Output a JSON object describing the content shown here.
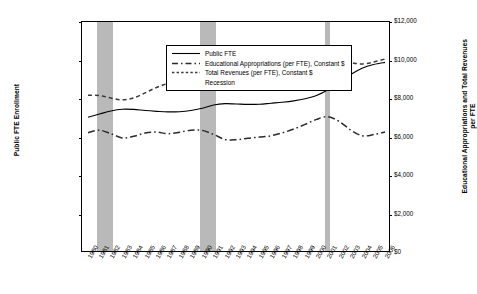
{
  "chart_data": {
    "type": "line",
    "title": "",
    "xlabel": "",
    "ylabel": "Public FTE Enrollment",
    "y2label": "Educational Appropriations and Total Revenues per FTE",
    "grid": false,
    "legend_position": "top-left",
    "ylim": [
      0,
      12000000
    ],
    "y2lim": [
      0,
      12000
    ],
    "yticks": [
      "0",
      "2,000,000",
      "4,000,000",
      "6,000,000",
      "8,000,000",
      "10,000,000",
      "12,000,000"
    ],
    "y2ticks": [
      "$0",
      "$2,000",
      "$4,000",
      "$6,000",
      "$8,000",
      "$10,000",
      "$12,000"
    ],
    "categories": [
      "1980",
      "1981",
      "1982",
      "1983",
      "1984",
      "1985",
      "1986",
      "1987",
      "1988",
      "1989",
      "1990",
      "1991",
      "1992",
      "1993",
      "1994",
      "1995",
      "1996",
      "1997",
      "1998",
      "1999",
      "2000",
      "2001",
      "2002",
      "2003",
      "2004",
      "2005",
      "2006"
    ],
    "series": [
      {
        "name": "Public FTE",
        "axis": "left",
        "style": "solid",
        "values": [
          7050000,
          7220000,
          7380000,
          7470000,
          7460000,
          7400000,
          7360000,
          7330000,
          7340000,
          7400000,
          7520000,
          7690000,
          7760000,
          7740000,
          7720000,
          7730000,
          7780000,
          7830000,
          7900000,
          8010000,
          8180000,
          8480000,
          8900000,
          9280000,
          9600000,
          9790000,
          9900000
        ]
      },
      {
        "name": "Educational Appropriations (per FTE), Constant $",
        "axis": "right",
        "style": "dash-dot",
        "values": [
          6250,
          6380,
          6200,
          5980,
          6060,
          6230,
          6280,
          6200,
          6270,
          6380,
          6370,
          6160,
          5900,
          5880,
          5960,
          6020,
          6090,
          6240,
          6440,
          6680,
          6940,
          7080,
          6830,
          6390,
          6090,
          6150,
          6290
        ]
      },
      {
        "name": "Total Revenues (per FTE), Constant $",
        "axis": "right",
        "style": "dotted",
        "values": [
          8200,
          8180,
          8050,
          7960,
          8060,
          8320,
          8600,
          8820,
          9050,
          9280,
          9460,
          9490,
          9470,
          9460,
          9500,
          9520,
          9500,
          9530,
          9580,
          9700,
          9880,
          10100,
          10080,
          9900,
          9820,
          9920,
          10080
        ]
      }
    ],
    "recession_bands": [
      {
        "label": "Recession",
        "start": "1981",
        "end": "1982"
      },
      {
        "label": "Recession",
        "start": "1990",
        "end": "1991"
      },
      {
        "label": "Recession",
        "start": "2001",
        "end": "2001"
      }
    ],
    "legend": [
      {
        "label": "Public FTE",
        "key": "solid-line-key"
      },
      {
        "label": "Educational Appropriations (per FTE), Constant $",
        "key": "dash-dot-line-key"
      },
      {
        "label": "Total Revenues (per FTE), Constant $",
        "key": "dotted-line-key"
      },
      {
        "label": "Recession",
        "key": "gray-swatch-key"
      }
    ],
    "colors": {
      "line": "#000000",
      "recession_band": "#b9b9b9",
      "axis": "#000000",
      "background": "#ffffff"
    }
  }
}
